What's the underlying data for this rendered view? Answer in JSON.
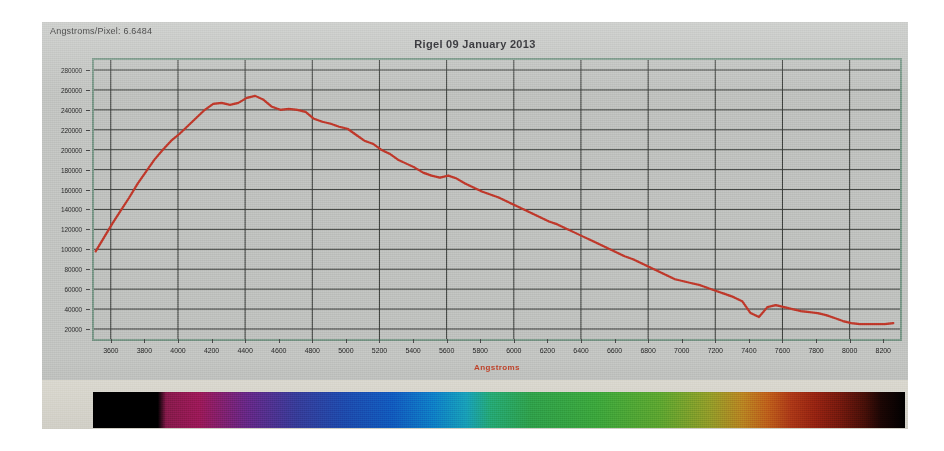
{
  "window": {
    "readout_label": "Angstroms/Pixel: 6.6484"
  },
  "chart_data": {
    "type": "line",
    "title": "Rigel 09 January 2013",
    "xlabel": "Angstroms",
    "ylabel": "",
    "xlim": [
      3500,
      8300
    ],
    "ylim": [
      10000,
      290000
    ],
    "grid": true,
    "legend": "none",
    "line_color": "#c0392b",
    "xticks": [
      3600,
      3800,
      4000,
      4200,
      4400,
      4600,
      4800,
      5000,
      5200,
      5400,
      5600,
      5800,
      6000,
      6200,
      6400,
      6600,
      6800,
      7000,
      7200,
      7400,
      7600,
      7800,
      8000,
      8200
    ],
    "yticks": [
      20000,
      40000,
      60000,
      80000,
      100000,
      120000,
      140000,
      160000,
      180000,
      200000,
      220000,
      240000,
      260000,
      280000
    ],
    "x_gridlines": [
      3600,
      4000,
      4400,
      4800,
      5200,
      5600,
      6000,
      6400,
      6800,
      7200,
      7600,
      8000
    ],
    "series": [
      {
        "name": "Rigel spectrum",
        "x": [
          3510,
          3560,
          3610,
          3660,
          3710,
          3760,
          3810,
          3860,
          3910,
          3960,
          4010,
          4060,
          4110,
          4160,
          4210,
          4260,
          4310,
          4360,
          4410,
          4460,
          4510,
          4560,
          4610,
          4660,
          4710,
          4760,
          4810,
          4860,
          4910,
          4960,
          5010,
          5060,
          5110,
          5160,
          5210,
          5260,
          5310,
          5360,
          5410,
          5460,
          5510,
          5560,
          5610,
          5660,
          5710,
          5760,
          5810,
          5860,
          5910,
          5960,
          6010,
          6060,
          6110,
          6160,
          6210,
          6260,
          6310,
          6360,
          6410,
          6460,
          6510,
          6560,
          6610,
          6660,
          6710,
          6760,
          6810,
          6860,
          6910,
          6960,
          7010,
          7060,
          7110,
          7160,
          7210,
          7260,
          7310,
          7360,
          7410,
          7460,
          7510,
          7560,
          7610,
          7660,
          7710,
          7760,
          7810,
          7860,
          7910,
          7960,
          8010,
          8060,
          8110,
          8160,
          8210,
          8260
        ],
        "y": [
          98000,
          112000,
          126000,
          139000,
          152000,
          166000,
          178000,
          190000,
          200000,
          209000,
          216000,
          224000,
          232000,
          240000,
          246000,
          247000,
          245000,
          247000,
          252000,
          254000,
          250000,
          243000,
          240000,
          241000,
          240000,
          238000,
          231000,
          228000,
          226000,
          223000,
          221000,
          215000,
          209000,
          206000,
          200000,
          196000,
          190000,
          186000,
          182000,
          177000,
          174000,
          172000,
          174000,
          171000,
          166000,
          162000,
          158000,
          155000,
          152000,
          148000,
          144000,
          140000,
          136000,
          132000,
          128000,
          125000,
          121000,
          117000,
          113000,
          109000,
          105000,
          101000,
          97000,
          93000,
          90000,
          86000,
          82000,
          78000,
          74000,
          70000,
          68000,
          66000,
          64000,
          61000,
          58000,
          55000,
          52000,
          48000,
          36000,
          32000,
          42000,
          44000,
          42000,
          40000,
          38000,
          37000,
          36000,
          34000,
          31000,
          28000,
          26000,
          25000,
          25000,
          25000,
          25000,
          26000
        ]
      }
    ]
  },
  "spectrum_strip": {
    "name": "spectrum-strip",
    "stops": [
      {
        "pos": 0,
        "color": "#000000"
      },
      {
        "pos": 8,
        "color": "#000000"
      },
      {
        "pos": 9,
        "color": "#8d1c4f"
      },
      {
        "pos": 13,
        "color": "#a31a5c"
      },
      {
        "pos": 19,
        "color": "#6b2a8e"
      },
      {
        "pos": 25,
        "color": "#3a3fa0"
      },
      {
        "pos": 31,
        "color": "#1f4fb5"
      },
      {
        "pos": 37,
        "color": "#1260c6"
      },
      {
        "pos": 42,
        "color": "#0f86cf"
      },
      {
        "pos": 46,
        "color": "#19a7c0"
      },
      {
        "pos": 49,
        "color": "#27b07a"
      },
      {
        "pos": 54,
        "color": "#32a84e"
      },
      {
        "pos": 62,
        "color": "#3fae3f"
      },
      {
        "pos": 70,
        "color": "#63ad32"
      },
      {
        "pos": 76,
        "color": "#9aa32b"
      },
      {
        "pos": 80,
        "color": "#c08a23"
      },
      {
        "pos": 83,
        "color": "#c6651c"
      },
      {
        "pos": 86,
        "color": "#b33a18"
      },
      {
        "pos": 89,
        "color": "#9c2412"
      },
      {
        "pos": 92,
        "color": "#7a1a0e"
      },
      {
        "pos": 95,
        "color": "#4a1008"
      },
      {
        "pos": 97,
        "color": "#1d0604"
      },
      {
        "pos": 100,
        "color": "#000000"
      }
    ]
  }
}
